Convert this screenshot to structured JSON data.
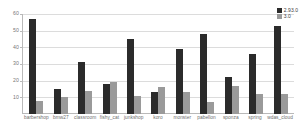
{
  "chart_data": {
    "type": "bar",
    "title": "",
    "xlabel": "",
    "ylabel": "",
    "ylim": [
      0,
      60
    ],
    "yticks": [
      10,
      20,
      30,
      40,
      50,
      60
    ],
    "grid": true,
    "legend_position": "top-right",
    "categories": [
      "barbershop",
      "bmw27",
      "classroom",
      "fishy_cat",
      "junkshop",
      "koro",
      "monster",
      "pabellon",
      "sponza",
      "spring",
      "wdas_cloud"
    ],
    "series": [
      {
        "name": "2.93.0",
        "color": "#2b2b2b",
        "values": [
          57,
          15,
          31,
          18,
          45,
          13,
          39,
          48,
          22,
          36,
          53
        ]
      },
      {
        "name": "3.0",
        "color": "#9a9a9a",
        "values": [
          8,
          10,
          14,
          19,
          11,
          16,
          13,
          7,
          17,
          12,
          12
        ]
      }
    ]
  },
  "legend": {
    "items": [
      {
        "label": "2.93.0",
        "swatch": "v1"
      },
      {
        "label": "3.0",
        "swatch": "v2"
      }
    ]
  },
  "colors": {
    "series_1": "#2b2b2b",
    "series_2": "#9a9a9a",
    "gridline": "#dcdcdc",
    "axis": "#b9b9b9",
    "tick_text": "#777777",
    "background": "#ffffff"
  }
}
